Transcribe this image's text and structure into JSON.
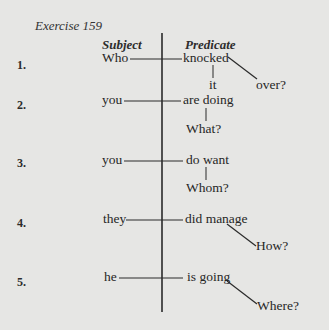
{
  "title": "Exercise 159",
  "headers": {
    "subject": "Subject",
    "predicate": "Predicate"
  },
  "rows": [
    {
      "number": "1.",
      "subject": "Who",
      "predicate": "knocked",
      "object": "it",
      "modifier": "over?"
    },
    {
      "number": "2.",
      "subject": "you",
      "predicate": "are doing",
      "object": "What?"
    },
    {
      "number": "3.",
      "subject": "you",
      "predicate": "do want",
      "object": "Whom?"
    },
    {
      "number": "4.",
      "subject": "they",
      "predicate": "did manage",
      "modifier": "How?"
    },
    {
      "number": "5.",
      "subject": "he",
      "predicate": "is going",
      "modifier": "Where?"
    }
  ]
}
